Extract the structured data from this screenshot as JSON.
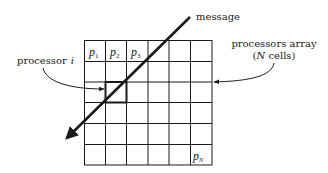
{
  "diagram": {
    "labels": {
      "message": "message",
      "processor_prefix": "processor",
      "processor_var": "i",
      "array_line1": "processors array",
      "array_line2_open": "(",
      "array_line2_var": "N",
      "array_line2_rest": " cells)"
    },
    "grid": {
      "rows": 6,
      "cols": 6,
      "cell_labels": [
        {
          "base": "p",
          "sub": "1",
          "row": 0,
          "col": 0
        },
        {
          "base": "p",
          "sub": "2",
          "row": 0,
          "col": 1
        },
        {
          "base": "p",
          "sub": "3",
          "row": 0,
          "col": 2
        },
        {
          "base": "p",
          "sub": "N",
          "row": 5,
          "col": 5
        }
      ],
      "highlighted_cell": {
        "row": 2,
        "col": 1
      }
    },
    "colors": {
      "line": "#1a1a1a",
      "background": "#ffffff"
    }
  }
}
